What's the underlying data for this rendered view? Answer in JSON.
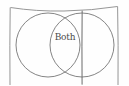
{
  "diagram": {
    "type": "venn",
    "title": "",
    "style": "hand-drawn",
    "background_color": "#fefefe",
    "line_color": "#8a8a8a",
    "circle_stroke_color": "#6e6e6e",
    "label_color": "#4a4a4a",
    "frame": {
      "name": "outer-rectangle",
      "left": 10,
      "top": 6,
      "right": 118,
      "bottom": 84,
      "columns": 3,
      "divider_x": [
        48,
        82
      ]
    },
    "circles": [
      {
        "id": "left-circle",
        "label": "",
        "cx": 48,
        "cy": 45,
        "r": 32
      },
      {
        "id": "right-circle",
        "label": "",
        "cx": 82,
        "cy": 45,
        "r": 32
      }
    ],
    "regions": [
      {
        "id": "left-only",
        "label": ""
      },
      {
        "id": "overlap",
        "label": "Both"
      },
      {
        "id": "right-only",
        "label": ""
      }
    ],
    "overlap_label": "Both"
  }
}
